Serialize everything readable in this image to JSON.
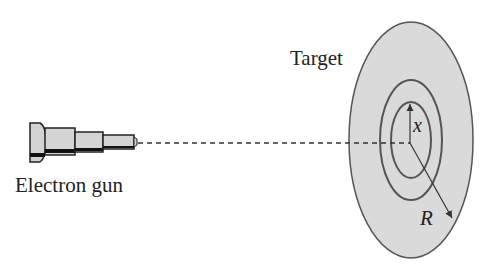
{
  "diagram": {
    "labels": {
      "gun": "Electron gun",
      "target": "Target",
      "inner_radius": "x",
      "outer_radius": "R"
    },
    "colors": {
      "target_fill": "#d9d9d9",
      "stroke": "#444444",
      "gun_fill": "#d0d0d0"
    }
  }
}
